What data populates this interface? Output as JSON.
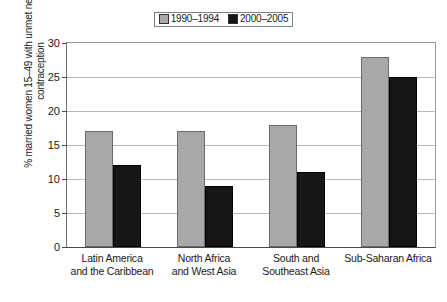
{
  "chart_data": {
    "type": "bar",
    "title": "",
    "subtitle": "",
    "xlabel": "",
    "ylabel": "% married women 15–49 with unmet need for contraception",
    "ylim": [
      0,
      30
    ],
    "ytick_labels": [
      "0",
      "5",
      "10",
      "15",
      "20",
      "25",
      "30"
    ],
    "ytick_values": [
      0,
      5,
      10,
      15,
      20,
      25,
      30
    ],
    "grid": true,
    "legend_position": "top-center",
    "categories": [
      "Latin America and the Caribbean",
      "North Africa and West Asia",
      "South and Southeast Asia",
      "Sub-Saharan Africa"
    ],
    "category_lines": [
      [
        "Latin America",
        "and the Caribbean"
      ],
      [
        "North Africa",
        "and West Asia"
      ],
      [
        "South and",
        "Southeast Asia"
      ],
      [
        "Sub-Saharan Africa",
        ""
      ]
    ],
    "series": [
      {
        "name": "1990–1994",
        "color": "#a8a8a8",
        "values": [
          17,
          17,
          18,
          28
        ]
      },
      {
        "name": "2000–2005",
        "color": "#161616",
        "values": [
          12,
          9,
          11,
          25
        ]
      }
    ]
  },
  "legend": {
    "entries": [
      {
        "label": "1990–1994",
        "swatch": "legend-swatch-gray"
      },
      {
        "label": "2000–2005",
        "swatch": "legend-swatch-black"
      }
    ]
  }
}
